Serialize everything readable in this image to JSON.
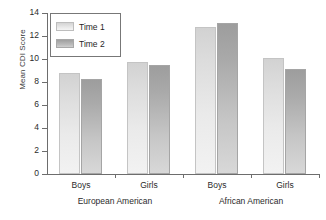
{
  "chart_data": {
    "type": "bar",
    "title": "",
    "subtitle": "",
    "xlabel": "",
    "ylabel": "Mean CDI Score",
    "ylim": [
      0,
      14
    ],
    "yticks": [
      0,
      2,
      4,
      6,
      8,
      10,
      12,
      14
    ],
    "ytick_labels": [
      "0",
      "2",
      "4",
      "6",
      "8",
      "10",
      "12",
      "14"
    ],
    "grid": false,
    "legend_position": "upper-left-inside",
    "categories": [
      "Boys",
      "Girls",
      "Boys",
      "Girls"
    ],
    "groups": [
      {
        "label": "European American",
        "categories": [
          "Boys",
          "Girls"
        ]
      },
      {
        "label": "African American",
        "categories": [
          "Boys",
          "Girls"
        ]
      }
    ],
    "series": [
      {
        "name": "Time 1",
        "color": "#e2e2e2",
        "values": [
          8.8,
          9.7,
          12.8,
          10.1
        ]
      },
      {
        "name": "Time 2",
        "color": "#b0b0b0",
        "values": [
          8.3,
          9.5,
          13.1,
          9.1
        ]
      }
    ],
    "legend": [
      "Time 1",
      "Time 2"
    ],
    "annotations": []
  },
  "axes": {
    "y": {
      "label": "Mean CDI Score",
      "ticks": [
        "14",
        "12",
        "10",
        "8",
        "6",
        "4",
        "2",
        "0"
      ]
    },
    "x": {
      "category_labels": [
        "Boys",
        "Girls",
        "Boys",
        "Girls"
      ],
      "group_labels": [
        "European American",
        "African American"
      ]
    }
  },
  "legend": {
    "entries": [
      {
        "label": "Time 1"
      },
      {
        "label": "Time 2"
      }
    ]
  }
}
